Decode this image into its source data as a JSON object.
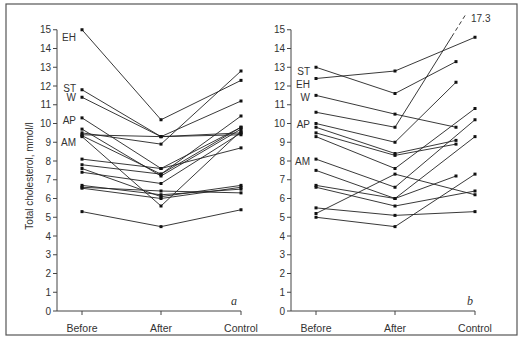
{
  "chart_data": [
    {
      "type": "line",
      "panel": "a",
      "ylabel": "Total cholesterol, mmol/l",
      "xlabel": "",
      "categories": [
        "Before",
        "After",
        "Control"
      ],
      "ylim": [
        0,
        15
      ],
      "yticks": [
        0,
        1,
        2,
        3,
        4,
        5,
        6,
        7,
        8,
        9,
        10,
        11,
        12,
        13,
        14,
        15
      ],
      "grid": false,
      "legend": "none",
      "series": [
        {
          "name": "EH",
          "values": [
            15.0,
            10.2,
            12.3
          ]
        },
        {
          "name": "ST",
          "values": [
            11.8,
            9.3,
            9.4
          ]
        },
        {
          "name": "W",
          "values": [
            11.4,
            9.3,
            11.2
          ]
        },
        {
          "name": "AP",
          "values": [
            10.3,
            7.6,
            9.8
          ]
        },
        {
          "name": "",
          "values": [
            9.7,
            7.2,
            9.7
          ]
        },
        {
          "name": "",
          "values": [
            9.5,
            8.9,
            12.8
          ]
        },
        {
          "name": "AM",
          "values": [
            9.4,
            9.3,
            9.5
          ]
        },
        {
          "name": "",
          "values": [
            9.3,
            5.6,
            9.6
          ]
        },
        {
          "name": "",
          "values": [
            9.35,
            7.3,
            10.4
          ]
        },
        {
          "name": "",
          "values": [
            8.1,
            7.6,
            8.7
          ]
        },
        {
          "name": "",
          "values": [
            7.8,
            7.3,
            9.8
          ]
        },
        {
          "name": "",
          "values": [
            7.6,
            6.1,
            6.7
          ]
        },
        {
          "name": "",
          "values": [
            7.4,
            6.8,
            9.5
          ]
        },
        {
          "name": "",
          "values": [
            6.7,
            6.2,
            6.5
          ]
        },
        {
          "name": "",
          "values": [
            6.6,
            6.4,
            6.3
          ]
        },
        {
          "name": "",
          "values": [
            6.55,
            6.0,
            6.6
          ]
        },
        {
          "name": "",
          "values": [
            5.3,
            4.5,
            5.4
          ]
        }
      ],
      "annotations": [
        "EH",
        "ST",
        "W",
        "AP",
        "AM",
        "a"
      ]
    },
    {
      "type": "line",
      "panel": "b",
      "ylabel": "",
      "xlabel": "",
      "categories": [
        "Before",
        "After",
        "Control"
      ],
      "ylim": [
        0,
        15
      ],
      "yticks": [
        0,
        1,
        2,
        3,
        4,
        5,
        6,
        7,
        8,
        9,
        10,
        11,
        12,
        13,
        14,
        15
      ],
      "grid": false,
      "legend": "none",
      "series": [
        {
          "name": "ST",
          "values": [
            13.0,
            11.6,
            13.3
          ]
        },
        {
          "name": "EH",
          "values": [
            12.4,
            12.8,
            14.6
          ]
        },
        {
          "name": "W",
          "values": [
            11.5,
            10.5,
            9.8
          ]
        },
        {
          "name": "",
          "values": [
            10.6,
            9.8,
            17.3
          ],
          "dashed_to_off_scale": true
        },
        {
          "name": "AP",
          "values": [
            10.0,
            9.0,
            12.2
          ]
        },
        {
          "name": "",
          "values": [
            9.8,
            8.4,
            9.1
          ]
        },
        {
          "name": "",
          "values": [
            9.5,
            8.3,
            8.9
          ]
        },
        {
          "name": "",
          "values": [
            9.3,
            7.6,
            10.8
          ]
        },
        {
          "name": "AM",
          "values": [
            8.1,
            6.6,
            10.2
          ]
        },
        {
          "name": "",
          "values": [
            7.5,
            6.0,
            9.3
          ]
        },
        {
          "name": "",
          "values": [
            6.7,
            6.0,
            7.2
          ]
        },
        {
          "name": "",
          "values": [
            6.6,
            5.6,
            6.4
          ]
        },
        {
          "name": "",
          "values": [
            5.5,
            5.1,
            5.3
          ]
        },
        {
          "name": "",
          "values": [
            5.2,
            7.3,
            6.2
          ]
        },
        {
          "name": "",
          "values": [
            5.0,
            4.5,
            7.3
          ]
        }
      ],
      "annotations": [
        "ST",
        "EH",
        "W",
        "AP",
        "AM",
        "17.3",
        "b"
      ]
    }
  ],
  "figure": {
    "ylabel": "Total cholesterol, mmol/l",
    "panel_a_letter": "a",
    "panel_b_letter": "b",
    "offscale_label": "17.3",
    "categories": [
      "Before",
      "After",
      "Control"
    ]
  }
}
